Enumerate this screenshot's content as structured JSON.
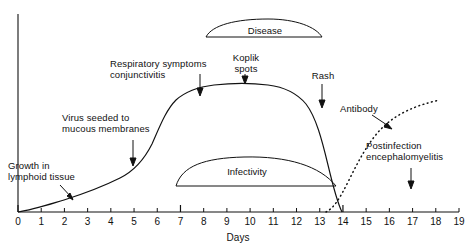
{
  "figure": {
    "title": "",
    "background_color": "#ffffff",
    "line_color": "#111111"
  },
  "axis": {
    "x_title": "Days",
    "x_min": 0,
    "x_max": 19,
    "ticks": [
      0,
      1,
      2,
      3,
      4,
      5,
      6,
      7,
      8,
      9,
      10,
      11,
      12,
      13,
      14,
      15,
      16,
      17,
      18,
      19
    ],
    "major_ticks": [
      0,
      7,
      14
    ],
    "y_title": "",
    "y_tick_labels": []
  },
  "annotations": [
    {
      "name": "growth-in-lymphoid-tissue",
      "text": "Growth in\nlymphoid tissue",
      "day": 3,
      "arrow": "diagonal-down-right"
    },
    {
      "name": "virus-seeded-to-mucous-membranes",
      "text": "Virus seeded to\nmucous membranes",
      "day": 6,
      "arrow": "down"
    },
    {
      "name": "respiratory-symptoms-conjunctivitis",
      "text": "Respiratory symptoms\nconjunctivitis",
      "day": 9,
      "arrow": "down"
    },
    {
      "name": "koplik-spots",
      "text": "Koplik\nspots",
      "day": 11,
      "arrow": "down"
    },
    {
      "name": "rash",
      "text": "Rash",
      "day": 14,
      "arrow": "down"
    },
    {
      "name": "antibody",
      "text": "Antibody",
      "day": 16,
      "arrow": "diagonal-down-right"
    },
    {
      "name": "postinfection-encephalomyelitis",
      "text": "Postinfection\nencephalomyelitis",
      "day": 17,
      "arrow": "down"
    }
  ],
  "bands": [
    {
      "name": "disease",
      "label": "Disease",
      "start_day": 8,
      "end_day": 13.2
    },
    {
      "name": "infectivity",
      "label": "Infectivity",
      "start_day": 7.2,
      "end_day": 15.4
    }
  ],
  "chart_data": {
    "type": "line",
    "title": "",
    "xlabel": "Days",
    "ylabel": "",
    "xlim": [
      0,
      19
    ],
    "ylim": [
      0,
      1
    ],
    "grid": false,
    "legend": "none",
    "x": [
      0,
      1,
      2,
      3,
      4,
      5,
      6,
      7,
      8,
      9,
      10,
      11,
      12,
      13,
      14,
      15,
      16,
      17,
      18,
      19
    ],
    "series": [
      {
        "name": "Virus titer",
        "style": "solid",
        "values": [
          0.0,
          0.01,
          0.03,
          0.05,
          0.07,
          0.1,
          0.14,
          0.25,
          0.62,
          0.86,
          0.9,
          0.9,
          0.88,
          0.84,
          0.7,
          0.18,
          0.0,
          0.0,
          0.0,
          0.0
        ]
      },
      {
        "name": "Antibody",
        "style": "dotted",
        "values": [
          0.0,
          0.0,
          0.0,
          0.0,
          0.0,
          0.0,
          0.0,
          0.0,
          0.0,
          0.0,
          0.0,
          0.0,
          0.0,
          0.0,
          0.02,
          0.14,
          0.38,
          0.56,
          0.66,
          0.71
        ]
      }
    ]
  }
}
